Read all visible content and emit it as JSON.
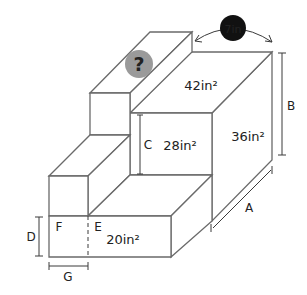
{
  "diagram": {
    "type": "3d-stepped-block-figure",
    "areas": {
      "top_face": "42in²",
      "side_face": "36in²",
      "inner_front_face": "28in²",
      "lower_front_face": "20in²"
    },
    "dimension_labels": {
      "a": "A",
      "b": "B",
      "c": "C",
      "d": "D",
      "e": "E",
      "f": "F",
      "g": "G"
    },
    "badges": {
      "unknown": "?",
      "width": "7in"
    },
    "colors": {
      "unknown_badge": "#9a9a9a",
      "width_badge": "#111111",
      "lines": "#6a6a6a"
    }
  }
}
